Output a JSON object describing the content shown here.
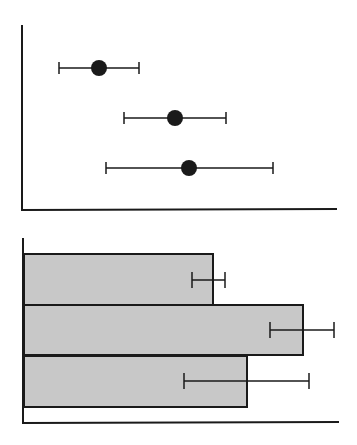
{
  "colors": {
    "background": "#ffffff",
    "ink": "#1a1a1a",
    "bar_fill": "#c8c8c8"
  },
  "chart_data": [
    {
      "type": "scatter",
      "title": "",
      "xlabel": "",
      "ylabel": "",
      "orientation": "horizontal-errorbars",
      "grid": false,
      "legend": "none",
      "categories": [
        "1",
        "2",
        "3"
      ],
      "x": [
        99,
        175,
        189
      ],
      "values": [
        0.24,
        0.49,
        0.53
      ],
      "error_low": [
        0.12,
        0.33,
        0.27
      ],
      "error_high": [
        0.37,
        0.65,
        0.8
      ],
      "xlim": [
        0,
        1
      ],
      "pixel": {
        "axis_x0": 22,
        "axis_x1": 337,
        "axis_y0": 25,
        "axis_y1": 210,
        "points": [
          {
            "cx": 99,
            "cy": 68,
            "lo": 59,
            "hi": 139
          },
          {
            "cx": 175,
            "cy": 118,
            "lo": 124,
            "hi": 226
          },
          {
            "cx": 189,
            "cy": 168,
            "lo": 106,
            "hi": 273
          }
        ]
      }
    },
    {
      "type": "bar",
      "title": "",
      "xlabel": "",
      "ylabel": "",
      "orientation": "horizontal",
      "grid": false,
      "legend": "none",
      "categories": [
        "1",
        "2",
        "3"
      ],
      "values": [
        0.6,
        0.89,
        0.71
      ],
      "error_low": [
        0.53,
        0.79,
        0.51
      ],
      "error_high": [
        0.64,
        0.99,
        0.91
      ],
      "xlim": [
        0,
        1
      ],
      "pixel": {
        "axis_x0": 23,
        "axis_x1": 339,
        "axis_y0": 238,
        "axis_y1": 423,
        "bars": [
          {
            "x0": 24,
            "x1": 213,
            "y0": 254,
            "y1": 305,
            "ey": 280,
            "lo": 192,
            "hi": 225
          },
          {
            "x0": 24,
            "x1": 303,
            "y0": 305,
            "y1": 355,
            "ey": 330,
            "lo": 270,
            "hi": 334
          },
          {
            "x0": 24,
            "x1": 247,
            "y0": 356,
            "y1": 407,
            "ey": 381,
            "lo": 184,
            "hi": 309
          }
        ]
      }
    }
  ]
}
